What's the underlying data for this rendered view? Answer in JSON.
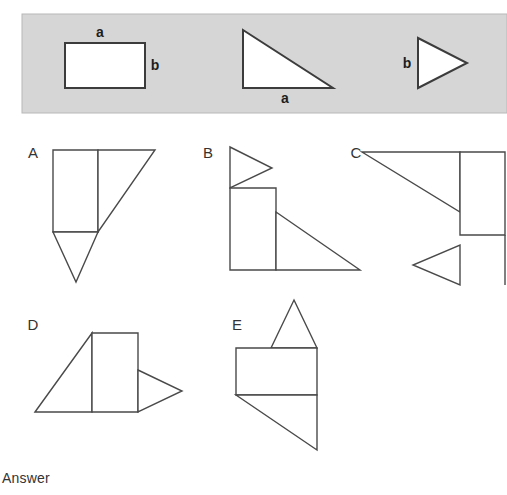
{
  "page": {
    "background_color": "#ffffff",
    "answer_label": "Answer"
  },
  "prompt_band": {
    "background_color": "#d6d6d6",
    "border_color": "#b8b8b8",
    "x": 22,
    "y": 14,
    "width": 485,
    "height": 99,
    "shapes": [
      {
        "name": "rectangle",
        "type": "rect",
        "points": "65,43 145,43 145,88 65,88",
        "labels": [
          {
            "text": "a",
            "x": 100,
            "y": 37,
            "anchor": "middle"
          },
          {
            "text": "b",
            "x": 155,
            "y": 70,
            "anchor": "middle"
          }
        ]
      },
      {
        "name": "large-right-triangle",
        "type": "polygon",
        "points": "243,30 243,88 333,88",
        "labels": [
          {
            "text": "a",
            "x": 285,
            "y": 103,
            "anchor": "middle"
          }
        ]
      },
      {
        "name": "small-right-pointing-triangle",
        "type": "polygon",
        "points": "418,38 467,63 418,88",
        "labels": [
          {
            "text": "b",
            "x": 407,
            "y": 68,
            "anchor": "middle"
          }
        ]
      }
    ]
  },
  "options": [
    {
      "id": "A",
      "label": "A",
      "label_x": 33,
      "label_y": 158,
      "parts": [
        {
          "name": "option-a-rectangle",
          "points": "53,150 98,150 98,232 53,232"
        },
        {
          "name": "option-a-large-triangle",
          "points": "98,150 155,150 98,232"
        },
        {
          "name": "option-a-small-triangle",
          "points": "53,232 98,232 76,282"
        }
      ]
    },
    {
      "id": "B",
      "label": "B",
      "label_x": 208,
      "label_y": 158,
      "parts": [
        {
          "name": "option-b-small-triangle",
          "points": "230,147 272,168 230,188"
        },
        {
          "name": "option-b-rectangle",
          "points": "230,188 276,188 276,270 230,270"
        },
        {
          "name": "option-b-large-triangle",
          "points": "276,212 360,270 276,270"
        }
      ]
    },
    {
      "id": "C",
      "label": "C",
      "label_x": 356,
      "label_y": 158,
      "parts": [
        {
          "name": "option-c-large-triangle",
          "points": "362,152 460,152 460,212"
        },
        {
          "name": "option-c-rectangle",
          "points": "460,152 505,152 505,235 460,235"
        },
        {
          "name": "option-c-small-triangle",
          "points": "460,245 460,285 413,265"
        },
        {
          "name": "option-c-right-edge",
          "points": "505,235 505,285",
          "open": true
        }
      ]
    },
    {
      "id": "D",
      "label": "D",
      "label_x": 33,
      "label_y": 330,
      "parts": [
        {
          "name": "option-d-large-triangle",
          "points": "35,412 92,333 92,412"
        },
        {
          "name": "option-d-rectangle",
          "points": "92,333 138,333 138,412 92,412"
        },
        {
          "name": "option-d-small-triangle",
          "points": "138,370 182,391 138,412"
        }
      ]
    },
    {
      "id": "E",
      "label": "E",
      "label_x": 237,
      "label_y": 330,
      "parts": [
        {
          "name": "option-e-small-triangle",
          "points": "294,300 317,348 271,348"
        },
        {
          "name": "option-e-rectangle",
          "points": "236,348 317,348 317,395 236,395"
        },
        {
          "name": "option-e-large-triangle",
          "points": "236,395 317,395 317,450"
        }
      ]
    }
  ]
}
